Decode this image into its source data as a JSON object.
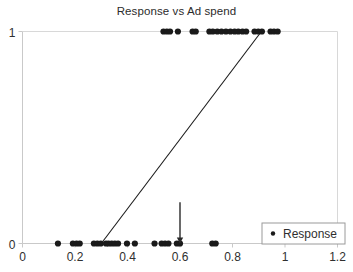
{
  "chart_data": {
    "type": "scatter",
    "title": "Response vs Ad spend",
    "xlabel": "",
    "ylabel": "",
    "xlim": [
      0,
      1.2
    ],
    "ylim": [
      0,
      1
    ],
    "grid": false,
    "legend_position": "bottom-right",
    "x_ticks": [
      "0",
      "0.2",
      "0.4",
      "0.6",
      "0.8",
      "1",
      "1.2"
    ],
    "x_tick_values": [
      0,
      0.2,
      0.4,
      0.6,
      0.8,
      1,
      1.2
    ],
    "y_ticks": [
      "0",
      "1"
    ],
    "y_tick_values": [
      0,
      1
    ],
    "series": [
      {
        "name": "Response",
        "type": "scatter",
        "marker": "circle",
        "color": "#1a1a1a",
        "points": [
          {
            "x": 0.135,
            "y": 0
          },
          {
            "x": 0.192,
            "y": 0
          },
          {
            "x": 0.206,
            "y": 0
          },
          {
            "x": 0.218,
            "y": 0
          },
          {
            "x": 0.272,
            "y": 0
          },
          {
            "x": 0.285,
            "y": 0
          },
          {
            "x": 0.298,
            "y": 0
          },
          {
            "x": 0.318,
            "y": 0
          },
          {
            "x": 0.328,
            "y": 0
          },
          {
            "x": 0.34,
            "y": 0
          },
          {
            "x": 0.352,
            "y": 0
          },
          {
            "x": 0.364,
            "y": 0
          },
          {
            "x": 0.398,
            "y": 0
          },
          {
            "x": 0.428,
            "y": 0
          },
          {
            "x": 0.503,
            "y": 0
          },
          {
            "x": 0.53,
            "y": 0
          },
          {
            "x": 0.543,
            "y": 0
          },
          {
            "x": 0.556,
            "y": 0
          },
          {
            "x": 0.588,
            "y": 0
          },
          {
            "x": 0.6,
            "y": 0
          },
          {
            "x": 0.723,
            "y": 0
          },
          {
            "x": 0.736,
            "y": 0
          },
          {
            "x": 0.537,
            "y": 1
          },
          {
            "x": 0.55,
            "y": 1
          },
          {
            "x": 0.562,
            "y": 1
          },
          {
            "x": 0.592,
            "y": 1
          },
          {
            "x": 0.648,
            "y": 1
          },
          {
            "x": 0.66,
            "y": 1
          },
          {
            "x": 0.712,
            "y": 1
          },
          {
            "x": 0.725,
            "y": 1
          },
          {
            "x": 0.742,
            "y": 1
          },
          {
            "x": 0.758,
            "y": 1
          },
          {
            "x": 0.775,
            "y": 1
          },
          {
            "x": 0.792,
            "y": 1
          },
          {
            "x": 0.808,
            "y": 1
          },
          {
            "x": 0.822,
            "y": 1
          },
          {
            "x": 0.838,
            "y": 1
          },
          {
            "x": 0.852,
            "y": 1
          },
          {
            "x": 0.884,
            "y": 1
          },
          {
            "x": 0.898,
            "y": 1
          },
          {
            "x": 0.912,
            "y": 1
          },
          {
            "x": 0.945,
            "y": 1
          },
          {
            "x": 0.958,
            "y": 1
          },
          {
            "x": 0.972,
            "y": 1
          }
        ]
      },
      {
        "name": "fit-line",
        "type": "line",
        "color": "#1a1a1a",
        "x": [
          0.3,
          0.91
        ],
        "y": [
          0.0,
          1.0
        ]
      }
    ],
    "annotations": [
      {
        "type": "arrow",
        "x": 0.6,
        "y_from": 0.195,
        "y_to": 0.0,
        "color": "#2a2a2a"
      }
    ],
    "legend": {
      "entries": [
        {
          "label": "Response",
          "marker": "circle",
          "color": "#1a1a1a"
        }
      ]
    }
  },
  "footer": {
    "ghost_text": ""
  }
}
